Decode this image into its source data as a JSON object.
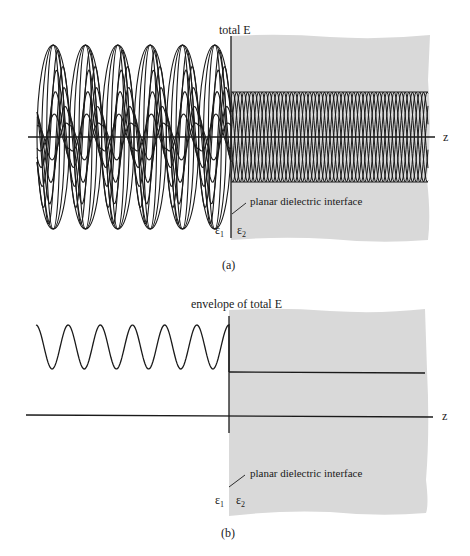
{
  "panel_a": {
    "y_label": "total E",
    "axis_label": "z",
    "interface_label": "planar dielectric interface",
    "eps1": "ε",
    "eps1_sub": "1",
    "eps2": "ε",
    "eps2_sub": "2",
    "caption": "(a)",
    "left_lobes": 6,
    "region2_color": "#d9d9d9"
  },
  "panel_b": {
    "y_label": "envelope of total E",
    "axis_label": "z",
    "interface_label": "planar dielectric interface",
    "eps1": "ε",
    "eps1_sub": "1",
    "eps2": "ε",
    "eps2_sub": "2",
    "caption": "(b)",
    "envelope_cycles": 6,
    "region2_color": "#d9d9d9"
  }
}
